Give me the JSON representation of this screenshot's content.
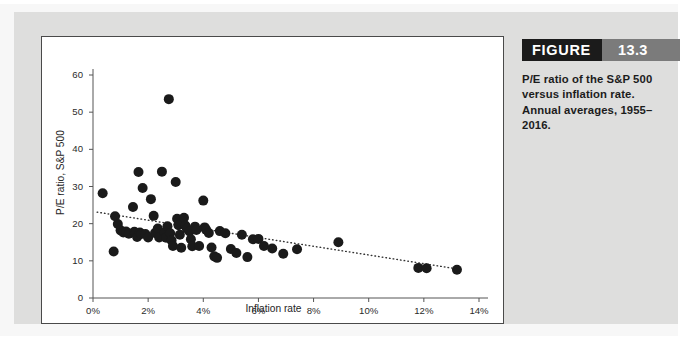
{
  "figure": {
    "label": "FIGURE",
    "number": "13.3",
    "caption": "P/E ratio of the S&P 500 versus inflation rate. Annual averages, 1955–2016."
  },
  "colors": {
    "page_background": "#ffffff",
    "panel_background": "#dededd",
    "plot_background": "#ffffff",
    "plot_border": "#4a4a4a",
    "header_label_bg": "#1b1b1b",
    "header_number_bg": "#7b7b7b",
    "header_text": "#ffffff",
    "point_color": "#1a1a1a",
    "trendline_color": "#333333",
    "axis_color": "#555555",
    "text_color": "#252525"
  },
  "chart_data": {
    "type": "scatter",
    "title": "",
    "xlabel": "Inflation rate",
    "ylabel": "P/E ratio, S&P 500",
    "xlim": [
      0,
      14
    ],
    "ylim": [
      0,
      60
    ],
    "xticks": [
      0,
      2,
      4,
      6,
      8,
      10,
      12,
      14
    ],
    "xtick_labels": [
      "0%",
      "2%",
      "4%",
      "6%",
      "8%",
      "10%",
      "12%",
      "14%"
    ],
    "yticks": [
      0,
      10,
      20,
      30,
      40,
      50,
      60
    ],
    "ytick_labels": [
      "0",
      "10",
      "20",
      "30",
      "40",
      "50",
      "60"
    ],
    "grid": false,
    "legend": false,
    "marker": "circle",
    "marker_size": 5,
    "points": [
      [
        0.35,
        28.2
      ],
      [
        0.75,
        12.5
      ],
      [
        0.8,
        22.0
      ],
      [
        0.9,
        19.9
      ],
      [
        1.0,
        18.2
      ],
      [
        1.1,
        17.6
      ],
      [
        1.2,
        17.9
      ],
      [
        1.3,
        17.3
      ],
      [
        1.45,
        24.5
      ],
      [
        1.5,
        17.8
      ],
      [
        1.55,
        17.4
      ],
      [
        1.6,
        16.4
      ],
      [
        1.65,
        33.9
      ],
      [
        1.7,
        17.6
      ],
      [
        1.75,
        17.2
      ],
      [
        1.8,
        29.6
      ],
      [
        1.9,
        17.2
      ],
      [
        2.0,
        16.3
      ],
      [
        2.1,
        26.6
      ],
      [
        2.2,
        22.1
      ],
      [
        2.25,
        17.5
      ],
      [
        2.35,
        18.7
      ],
      [
        2.4,
        16.3
      ],
      [
        2.5,
        34.0
      ],
      [
        2.6,
        17.6
      ],
      [
        2.65,
        16.2
      ],
      [
        2.7,
        19.3
      ],
      [
        2.75,
        53.5
      ],
      [
        2.8,
        17.4
      ],
      [
        2.85,
        15.5
      ],
      [
        2.9,
        14.0
      ],
      [
        3.0,
        31.2
      ],
      [
        3.05,
        21.3
      ],
      [
        3.1,
        19.6
      ],
      [
        3.15,
        17.0
      ],
      [
        3.2,
        13.5
      ],
      [
        3.3,
        21.6
      ],
      [
        3.35,
        19.5
      ],
      [
        3.4,
        18.7
      ],
      [
        3.5,
        17.9
      ],
      [
        3.55,
        15.8
      ],
      [
        3.6,
        13.9
      ],
      [
        3.7,
        19.2
      ],
      [
        3.75,
        18.3
      ],
      [
        3.85,
        14.0
      ],
      [
        4.0,
        26.2
      ],
      [
        4.05,
        19.0
      ],
      [
        4.1,
        18.4
      ],
      [
        4.2,
        17.5
      ],
      [
        4.3,
        13.6
      ],
      [
        4.4,
        11.2
      ],
      [
        4.5,
        10.8
      ],
      [
        4.6,
        18.0
      ],
      [
        4.8,
        17.4
      ],
      [
        5.0,
        13.2
      ],
      [
        5.2,
        12.1
      ],
      [
        5.4,
        17.0
      ],
      [
        5.6,
        11.0
      ],
      [
        5.8,
        15.8
      ],
      [
        6.0,
        15.9
      ],
      [
        6.2,
        14.0
      ],
      [
        6.5,
        13.3
      ],
      [
        6.9,
        11.9
      ],
      [
        7.4,
        13.1
      ],
      [
        8.9,
        15.0
      ],
      [
        11.8,
        8.1
      ],
      [
        12.1,
        8.0
      ],
      [
        13.2,
        7.6
      ]
    ],
    "trendline": {
      "type": "linear-fit",
      "style": "dotted",
      "x_start": 0.15,
      "y_start": 23.1,
      "x_end": 13.4,
      "y_end": 7.6
    }
  }
}
